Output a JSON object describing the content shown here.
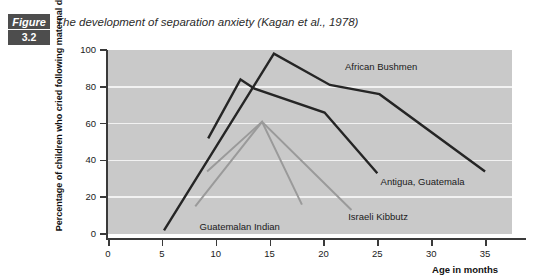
{
  "figure": {
    "badge_label": "Figure",
    "number": "3.2",
    "caption": "The development of separation anxiety (Kagan et al., 1978)",
    "badge_color": "#4d4d4d"
  },
  "chart_data": {
    "type": "line",
    "title": "The development of separation anxiety (Kagan et al., 1978)",
    "xlabel": "Age in months",
    "ylabel": "Percentage of children who cried following maternal departure",
    "xlim": [
      0,
      37.5
    ],
    "ylim": [
      0,
      100
    ],
    "xticks": [
      0,
      5,
      10,
      15,
      20,
      25,
      30,
      35
    ],
    "yticks": [
      0,
      20,
      40,
      60,
      80,
      100
    ],
    "xtick_labels": [
      "0",
      "5",
      "10",
      "15",
      "20",
      "25",
      "30",
      "35"
    ],
    "ytick_labels": [
      "0",
      "20",
      "40",
      "60",
      "80",
      "100"
    ],
    "grid": "horizontal",
    "plot_background": "#c9c9c9",
    "gridline_color": "#f2f2f2",
    "legend": "inline-annotations",
    "series": [
      {
        "name": "African Bushmen",
        "color": "#252525",
        "label_x": 22.0,
        "label_y": 91,
        "points": [
          {
            "x": 5.2,
            "y": 2
          },
          {
            "x": 15.4,
            "y": 98
          },
          {
            "x": 20.6,
            "y": 81
          },
          {
            "x": 25.2,
            "y": 76
          },
          {
            "x": 35.0,
            "y": 34
          }
        ]
      },
      {
        "name": "Antigua, Guatemala",
        "color": "#252525",
        "label_x": 25.3,
        "label_y": 28,
        "points": [
          {
            "x": 9.3,
            "y": 52
          },
          {
            "x": 12.3,
            "y": 84
          },
          {
            "x": 13.6,
            "y": 79
          },
          {
            "x": 20.1,
            "y": 66
          },
          {
            "x": 25.0,
            "y": 33
          }
        ]
      },
      {
        "name": "Israeli Kibbutz",
        "color": "#9a9a9a",
        "label_x": 22.3,
        "label_y": 9,
        "points": [
          {
            "x": 9.2,
            "y": 34
          },
          {
            "x": 14.3,
            "y": 61
          },
          {
            "x": 22.6,
            "y": 13
          }
        ]
      },
      {
        "name": "Guatemalan Indian",
        "color": "#9a9a9a",
        "label_x": 8.5,
        "label_y": 4,
        "points": [
          {
            "x": 8.1,
            "y": 15
          },
          {
            "x": 14.3,
            "y": 61
          },
          {
            "x": 18.0,
            "y": 16
          }
        ]
      }
    ]
  }
}
